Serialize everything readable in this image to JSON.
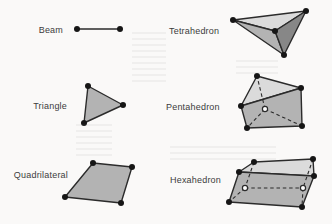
{
  "figure": {
    "background": "#faf9f8",
    "ink": "#2b2b2b",
    "label_color": "#3c3c3c",
    "colors": {
      "light_face": "#dbdbdb",
      "medium_face": "#b3b3b3",
      "dark_face": "#878787",
      "vertex": "#161616",
      "hidden_vertex_fill": "#ffffff"
    },
    "labels": [
      {
        "id": "beam",
        "text": "Beam",
        "x": 63,
        "y": 30,
        "align": "right"
      },
      {
        "id": "tetrahedron",
        "text": "Tetrahedron",
        "x": 169,
        "y": 31,
        "align": "left"
      },
      {
        "id": "triangle",
        "text": "Triangle",
        "x": 67,
        "y": 106,
        "align": "right"
      },
      {
        "id": "pentahedron",
        "text": "Pentahedron",
        "x": 166,
        "y": 107,
        "align": "left"
      },
      {
        "id": "quadrilateral",
        "text": "Quadrilateral",
        "x": 68,
        "y": 175,
        "align": "right"
      },
      {
        "id": "hexahedron",
        "text": "Hexahedron",
        "x": 170,
        "y": 180,
        "align": "left"
      }
    ],
    "shapes": [
      {
        "id": "beam",
        "lines": [
          [
            [
              77,
              29
            ],
            [
              120,
              29
            ]
          ]
        ],
        "vertices": [
          [
            77,
            29
          ],
          [
            120,
            29
          ]
        ]
      },
      {
        "id": "tetrahedron",
        "faces": [
          {
            "points": [
              [
                233,
                20
              ],
              [
                306,
                11
              ],
              [
                275,
                31
              ]
            ],
            "fill": "light_face"
          },
          {
            "points": [
              [
                233,
                20
              ],
              [
                275,
                31
              ],
              [
                284,
                55
              ]
            ],
            "fill": "medium_face"
          },
          {
            "points": [
              [
                275,
                31
              ],
              [
                306,
                11
              ],
              [
                284,
                55
              ]
            ],
            "fill": "dark_face"
          }
        ],
        "vertices": [
          [
            233,
            20
          ],
          [
            306,
            11
          ],
          [
            275,
            31
          ],
          [
            284,
            55
          ]
        ]
      },
      {
        "id": "triangle",
        "faces": [
          {
            "points": [
              [
                88,
                86
              ],
              [
                123,
                105
              ],
              [
                84,
                123
              ]
            ],
            "fill": "medium_face"
          }
        ],
        "vertices": [
          [
            88,
            86
          ],
          [
            123,
            105
          ],
          [
            84,
            123
          ]
        ]
      },
      {
        "id": "pentahedron",
        "faces": [
          {
            "points": [
              [
                257,
                76
              ],
              [
                241,
                106
              ],
              [
                301,
                88
              ]
            ],
            "fill": "light_face"
          },
          {
            "points": [
              [
                241,
                106
              ],
              [
                247,
                128
              ],
              [
                302,
                126
              ],
              [
                301,
                88
              ]
            ],
            "fill": "medium_face"
          }
        ],
        "hidden_edges": [
          [
            [
              265,
              109
            ],
            [
              257,
              76
            ]
          ],
          [
            [
              265,
              109
            ],
            [
              247,
              128
            ]
          ],
          [
            [
              265,
              109
            ],
            [
              302,
              126
            ]
          ]
        ],
        "vertices": [
          [
            257,
            76
          ],
          [
            301,
            88
          ],
          [
            241,
            106
          ],
          [
            247,
            128
          ],
          [
            302,
            126
          ]
        ],
        "hidden_vertices": [
          [
            265,
            109
          ]
        ]
      },
      {
        "id": "quadrilateral",
        "faces": [
          {
            "points": [
              [
                93,
                163
              ],
              [
                132,
                167
              ],
              [
                121,
                203
              ],
              [
                65,
                197
              ]
            ],
            "fill": "medium_face"
          }
        ],
        "vertices": [
          [
            93,
            163
          ],
          [
            132,
            167
          ],
          [
            121,
            203
          ],
          [
            65,
            197
          ]
        ]
      },
      {
        "id": "hexahedron",
        "faces": [
          {
            "points": [
              [
                254,
                162
              ],
              [
                313,
                159
              ],
              [
                314,
                176
              ],
              [
                239,
                172
              ]
            ],
            "fill": "light_face"
          },
          {
            "points": [
              [
                239,
                172
              ],
              [
                314,
                176
              ],
              [
                302,
                207
              ],
              [
                229,
                202
              ]
            ],
            "fill": "medium_face"
          }
        ],
        "hidden_edges": [
          [
            [
              254,
              162
            ],
            [
              245,
              188
            ]
          ],
          [
            [
              313,
              159
            ],
            [
              303,
              188
            ]
          ],
          [
            [
              245,
              188
            ],
            [
              303,
              188
            ]
          ],
          [
            [
              245,
              188
            ],
            [
              229,
              202
            ]
          ],
          [
            [
              303,
              188
            ],
            [
              302,
              207
            ]
          ]
        ],
        "vertices": [
          [
            254,
            162
          ],
          [
            313,
            159
          ],
          [
            239,
            172
          ],
          [
            314,
            176
          ],
          [
            229,
            202
          ],
          [
            302,
            207
          ]
        ],
        "hidden_vertices": [
          [
            245,
            188
          ],
          [
            303,
            188
          ]
        ]
      }
    ]
  }
}
